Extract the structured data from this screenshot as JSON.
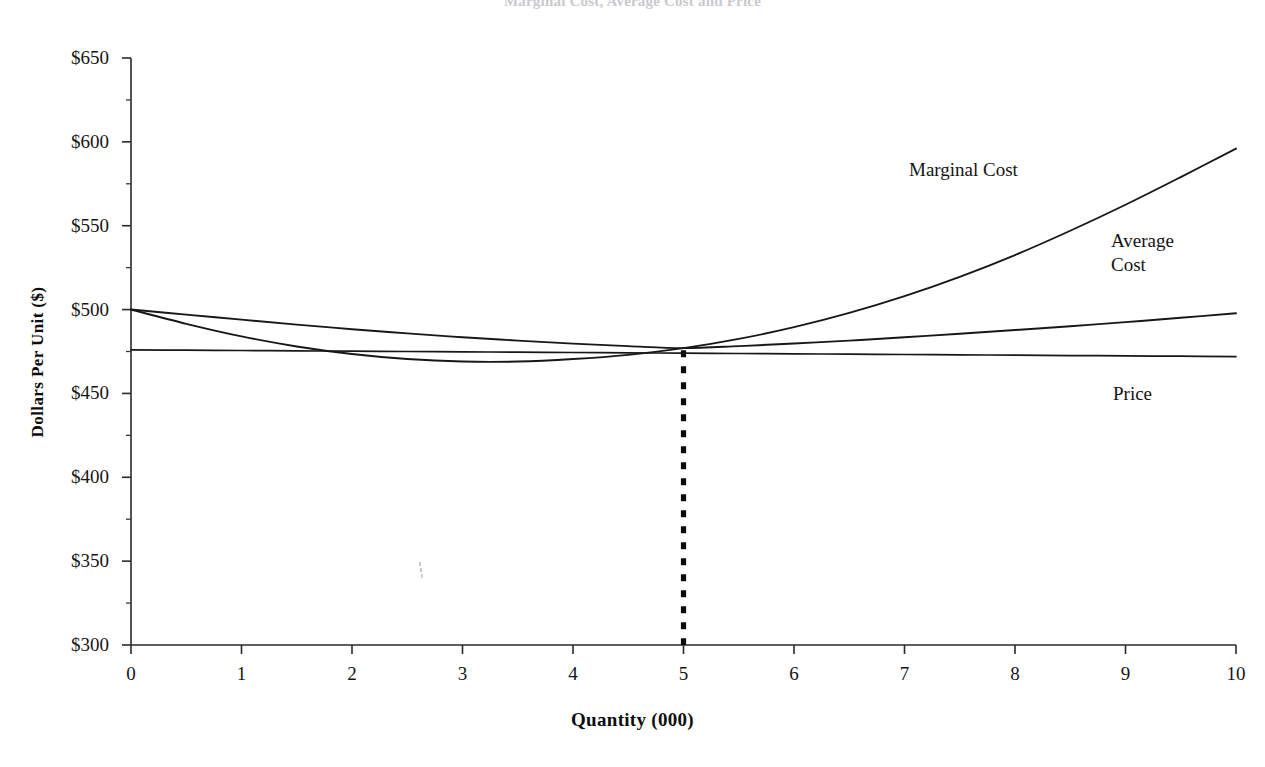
{
  "figure": {
    "title_partial": "Marginal Cost, Average Cost and Price",
    "title_visible": false,
    "background_color": "#ffffff",
    "ink_color": "#111111"
  },
  "annotations": [
    {
      "name": "marginal-cost",
      "text": "Marginal Cost",
      "x": 7.05,
      "y": 581
    },
    {
      "name": "average-cost",
      "text": "Average\nCost",
      "x": 8.85,
      "y": 539
    },
    {
      "name": "price",
      "text": "Price",
      "x": 8.87,
      "y": 447
    }
  ],
  "chart_data": {
    "type": "line",
    "title": "Marginal Cost, Average Cost and Price",
    "xlabel": "Quantity (000)",
    "ylabel": "Dollars Per Unit ($)",
    "xlim": [
      0,
      10
    ],
    "ylim": [
      300,
      650
    ],
    "xticks": [
      "0",
      "1",
      "2",
      "3",
      "4",
      "5",
      "6",
      "7",
      "8",
      "9",
      "10"
    ],
    "xtick_values": [
      0,
      1,
      2,
      3,
      4,
      5,
      6,
      7,
      8,
      9,
      10
    ],
    "yticks": [
      "$300",
      "$350",
      "$400",
      "$450",
      "$500",
      "$550",
      "$600",
      "$650"
    ],
    "ytick_values": [
      300,
      350,
      400,
      450,
      500,
      550,
      600,
      650
    ],
    "y_minor_tick_interval": 25,
    "grid": false,
    "legend": "inline-labels",
    "x": [
      0,
      0.5,
      1,
      1.5,
      2,
      2.5,
      3,
      3.5,
      4,
      4.5,
      5,
      5.5,
      6,
      6.5,
      7,
      7.5,
      8,
      8.5,
      9,
      9.5,
      10
    ],
    "series": [
      {
        "name": "Marginal Cost",
        "values": [
          500.0,
          491.5,
          484.0,
          478.0,
          473.5,
          470.5,
          469.0,
          469.0,
          470.5,
          473.0,
          477.0,
          482.5,
          489.5,
          498.0,
          508.0,
          519.5,
          532.5,
          547.0,
          562.5,
          579.0,
          596.0
        ]
      },
      {
        "name": "Average Cost",
        "values": [
          500.0,
          497.0,
          494.0,
          491.0,
          488.3,
          485.8,
          483.5,
          481.5,
          479.7,
          478.2,
          477.0,
          478.2,
          479.8,
          481.5,
          483.5,
          485.6,
          487.8,
          490.1,
          492.5,
          495.1,
          497.8
        ]
      },
      {
        "name": "Price",
        "values": [
          476.0,
          475.8,
          475.6,
          475.4,
          475.2,
          475.0,
          474.8,
          474.6,
          474.4,
          474.2,
          474.0,
          473.8,
          473.6,
          473.4,
          473.2,
          473.0,
          472.8,
          472.6,
          472.4,
          472.2,
          472.0
        ]
      }
    ],
    "annotations": {
      "equilibrium_dropline": {
        "label": "dashed vertical drop line at optimum quantity",
        "x": 5,
        "y_top": 477,
        "y_bottom": 300,
        "style": "dashed"
      }
    }
  }
}
